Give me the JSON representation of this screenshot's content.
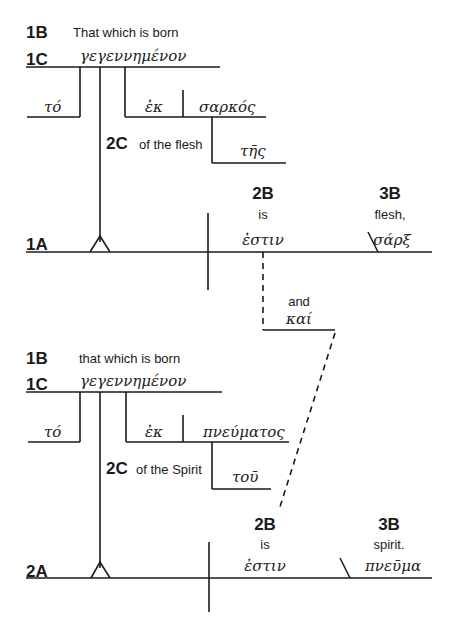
{
  "diagram": {
    "type": "sentence-diagram",
    "language": "Greek (with English glosses)",
    "clause1": {
      "label_1B": "1B",
      "gloss_1B": "That which is born",
      "label_1C": "1C",
      "participle": "γεγεννημένον",
      "article": "τό",
      "prep": "ἐκ",
      "prep_object": "σαρκός",
      "label_2C": "2C",
      "gloss_2C": "of the flesh",
      "modifier": "τῆς",
      "label_1A": "1A",
      "label_2B": "2B",
      "gloss_2B": "is",
      "verb": "ἐστιν",
      "label_3B": "3B",
      "gloss_3B": "flesh,",
      "complement": "σάρξ"
    },
    "conjunction": {
      "gloss": "and",
      "word": "καί"
    },
    "clause2": {
      "label_1B": "1B",
      "gloss_1B": "that which is born",
      "label_1C": "1C",
      "participle": "γεγεννημένον",
      "article": "τό",
      "prep": "ἐκ",
      "prep_object": "πνεύματος",
      "label_2C": "2C",
      "gloss_2C": "of the Spirit",
      "modifier": "τοῦ",
      "label_2A": "2A",
      "label_2B": "2B",
      "gloss_2B": "is",
      "verb": "ἐστιν",
      "label_3B": "3B",
      "gloss_3B": "spirit.",
      "complement": "πνεῦμα"
    },
    "line_color": "#1a1a1a"
  }
}
